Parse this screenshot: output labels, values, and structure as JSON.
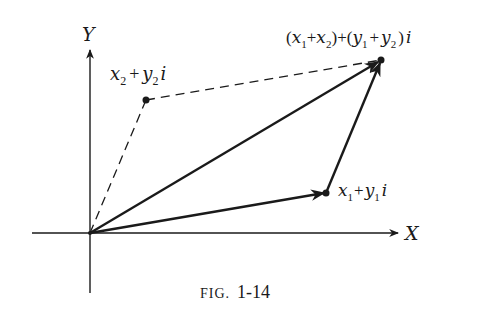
{
  "figure": {
    "caption_prefix": "FIG.",
    "caption_number": "1-14"
  },
  "axes": {
    "x_label": "X",
    "y_label": "Y"
  },
  "points": {
    "z1": {
      "base1": "x",
      "sub1": "1",
      "plus": "+",
      "base2": "y",
      "sub2": "1",
      "suffix": "i"
    },
    "z2": {
      "base1": "x",
      "sub1": "2",
      "plus": "+",
      "base2": "y",
      "sub2": "2",
      "suffix": "i"
    },
    "sum": {
      "open1": "(",
      "a": "x",
      "a_sub": "1",
      "plus1": "+",
      "b": "x",
      "b_sub": "2",
      "close1": ")",
      "plus_mid": "+",
      "open2": "(",
      "c": "y",
      "c_sub": "1",
      "plus2": "+",
      "d": "y",
      "d_sub": "2",
      "close2": ")",
      "suffix": "i"
    }
  },
  "colors": {
    "ink": "#1a1a1a",
    "background": "#ffffff"
  }
}
